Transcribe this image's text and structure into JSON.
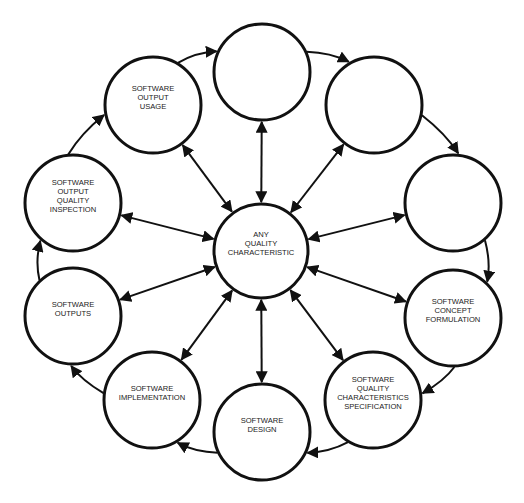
{
  "diagram": {
    "title": "",
    "center_node": {
      "id": "any-quality-characteristic",
      "lines": [
        "ANY",
        "QUALITY",
        "CHARACTERISTIC"
      ],
      "cx": 261,
      "cy": 251,
      "r": 47
    },
    "nodes": [
      {
        "id": "blank-top",
        "lines": [],
        "cx": 262,
        "cy": 72,
        "r": 48
      },
      {
        "id": "blank-top-right",
        "lines": [],
        "cx": 374,
        "cy": 105,
        "r": 48
      },
      {
        "id": "blank-right",
        "lines": [],
        "cx": 453,
        "cy": 203,
        "r": 48
      },
      {
        "id": "software-concept-formulation",
        "lines": [
          "SOFTWARE",
          "CONCEPT",
          "FORMULATION"
        ],
        "cx": 453,
        "cy": 318,
        "r": 48
      },
      {
        "id": "software-quality-characteristics-specification",
        "lines": [
          "SOFTWARE",
          "QUALITY",
          "CHARACTERISTICS",
          "SPECIFICATION"
        ],
        "cx": 373,
        "cy": 400,
        "r": 48
      },
      {
        "id": "software-design",
        "lines": [
          "SOFTWARE",
          "DESIGN"
        ],
        "cx": 262,
        "cy": 432,
        "r": 48
      },
      {
        "id": "software-implementation",
        "lines": [
          "SOFTWARE",
          "IMPLEMENTATION"
        ],
        "cx": 152,
        "cy": 400,
        "r": 48
      },
      {
        "id": "software-outputs",
        "lines": [
          "SOFTWARE",
          "OUTPUTS"
        ],
        "cx": 73,
        "cy": 316,
        "r": 48
      },
      {
        "id": "software-output-quality-inspection",
        "lines": [
          "SOFTWARE",
          "OUTPUT",
          "QUALITY",
          "INSPECTION"
        ],
        "cx": 73,
        "cy": 203,
        "r": 48
      },
      {
        "id": "software-output-usage",
        "lines": [
          "SOFTWARE",
          "OUTPUT",
          "USAGE"
        ],
        "cx": 153,
        "cy": 105,
        "r": 48
      }
    ],
    "cycle_edges": [
      {
        "from": "software-output-usage",
        "to": "blank-top",
        "direction": "one-way"
      },
      {
        "from": "blank-top",
        "to": "blank-top-right",
        "direction": "one-way"
      },
      {
        "from": "blank-top-right",
        "to": "blank-right",
        "direction": "one-way"
      },
      {
        "from": "blank-right",
        "to": "software-concept-formulation",
        "direction": "one-way"
      },
      {
        "from": "software-concept-formulation",
        "to": "software-quality-characteristics-specification",
        "direction": "one-way"
      },
      {
        "from": "software-quality-characteristics-specification",
        "to": "software-design",
        "direction": "one-way"
      },
      {
        "from": "software-design",
        "to": "software-implementation",
        "direction": "one-way"
      },
      {
        "from": "software-implementation",
        "to": "software-outputs",
        "direction": "one-way"
      },
      {
        "from": "software-outputs",
        "to": "software-output-quality-inspection",
        "direction": "one-way"
      },
      {
        "from": "software-output-quality-inspection",
        "to": "software-output-usage",
        "direction": "one-way"
      }
    ],
    "spoke_edges_direction": "bidirectional",
    "colors": {
      "stroke": "#111111",
      "fill": "#ffffff",
      "text": "#222222",
      "background": "#ffffff"
    }
  }
}
